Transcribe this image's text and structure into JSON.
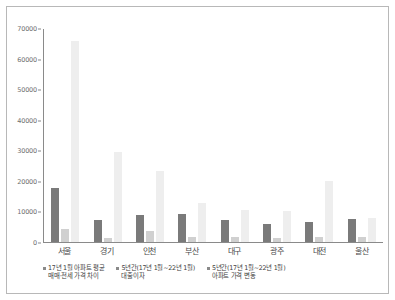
{
  "chart_data": {
    "type": "bar",
    "title": "",
    "subtitle": "",
    "xlabel": "",
    "ylabel": "",
    "ylim": [
      0,
      70000
    ],
    "ytick_step": 10000,
    "grid": false,
    "legend_position": "bottom-left",
    "categories": [
      "서울",
      "경기",
      "인천",
      "부산",
      "대구",
      "광주",
      "대전",
      "울산"
    ],
    "ytick_labels": [
      "0",
      "10000",
      "20000",
      "30000",
      "40000",
      "50000",
      "60000",
      "70000"
    ],
    "ytick_values": [
      0,
      10000,
      20000,
      30000,
      40000,
      50000,
      60000,
      70000
    ],
    "series": [
      {
        "name": "17년 1월 아파트 평균\n매매·전세 가격 차이",
        "color": "#7a7a7a",
        "values": [
          17800,
          7200,
          8800,
          9300,
          7200,
          5800,
          6500,
          7500
        ]
      },
      {
        "name": "5년간(17년 1월~22년 1월)\n대출이자",
        "color": "#d0d0d0",
        "values": [
          4300,
          1400,
          3600,
          1600,
          1600,
          1400,
          1500,
          1600
        ]
      },
      {
        "name": "5년간(17년 1월~22년 1월)\n아파트 가격 변동",
        "color": "#eeeeee",
        "values": [
          65800,
          29300,
          23200,
          12800,
          10400,
          10100,
          19800,
          8000
        ]
      }
    ]
  },
  "legend": {
    "items": [
      {
        "marker": "dot-marker",
        "label": "17년 1월 아파트 평균\n매매·전세 가격 차이"
      },
      {
        "marker": "dot-marker",
        "label": "5년간(17년 1월~22년 1월)\n대출이자"
      },
      {
        "marker": "dot-marker",
        "label": "5년간(17년 1월~22년 1월)\n아파트 가격 변동"
      }
    ]
  }
}
